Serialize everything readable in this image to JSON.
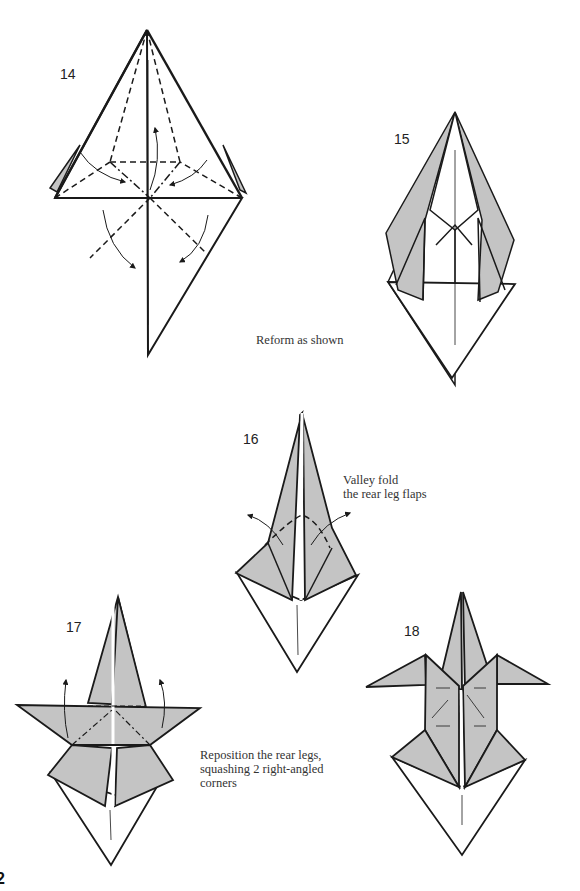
{
  "page": {
    "page_number": "2",
    "colors": {
      "paper_colored": "#c4c4c4",
      "paper_white": "#ffffff",
      "line": "#1a1a1a"
    }
  },
  "steps": [
    {
      "number": "14",
      "caption": ""
    },
    {
      "number": "15",
      "caption": "Reform as shown"
    },
    {
      "number": "16",
      "caption_lines": [
        "Valley fold",
        "the rear leg flaps"
      ]
    },
    {
      "number": "17",
      "caption_lines": [
        "Reposition the rear legs,",
        "squashing 2 right-angled",
        "corners"
      ]
    },
    {
      "number": "18",
      "caption": ""
    }
  ]
}
